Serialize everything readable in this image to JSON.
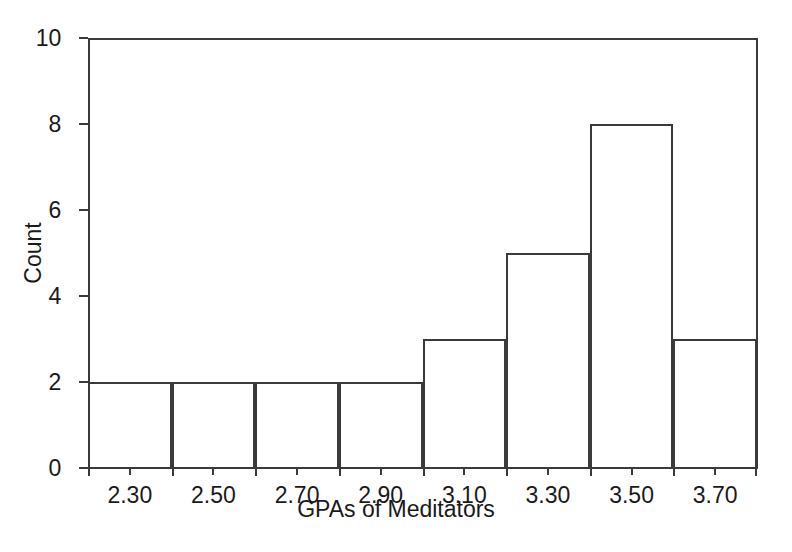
{
  "chart_data": {
    "type": "bar",
    "title": "",
    "xlabel": "GPAs of Meditators",
    "ylabel": "Count",
    "categories": [
      "2.30",
      "2.50",
      "2.70",
      "2.90",
      "3.10",
      "3.30",
      "3.50",
      "3.70"
    ],
    "values": [
      2,
      2,
      2,
      2,
      3,
      5,
      8,
      3
    ],
    "bin_edges": [
      2.2,
      2.4,
      2.6,
      2.8,
      3.0,
      3.2,
      3.4,
      3.6,
      3.8
    ],
    "bin_width": 0.2,
    "xlim": [
      2.2,
      3.8
    ],
    "ylim": [
      0,
      10
    ],
    "ytick_labels": [
      "0",
      "2",
      "4",
      "6",
      "8",
      "10"
    ],
    "ytick_values": [
      0,
      2,
      4,
      6,
      8,
      10
    ],
    "xtick_labels": [
      "2.30",
      "2.50",
      "2.70",
      "2.90",
      "3.10",
      "3.30",
      "3.50",
      "3.70"
    ],
    "grid": false,
    "legend": false,
    "legend_position": "none",
    "style": "outline-bars-no-fill",
    "colors": {
      "line": "#3a3a3a",
      "text": "#1a1a1a",
      "background": "#ffffff",
      "bar_fill": "transparent"
    },
    "total_count": 27
  }
}
